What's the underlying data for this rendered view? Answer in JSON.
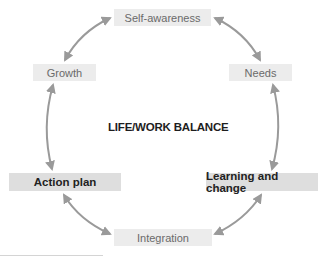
{
  "diagram": {
    "title": "LIFE/WORK BALANCE",
    "nodes": [
      {
        "id": "self-awareness",
        "label": "Self-awareness",
        "style": "light"
      },
      {
        "id": "needs",
        "label": "Needs",
        "style": "light"
      },
      {
        "id": "learning-and-change",
        "label": "Learning and change",
        "style": "bold"
      },
      {
        "id": "integration",
        "label": "Integration",
        "style": "light"
      },
      {
        "id": "action-plan",
        "label": "Action plan",
        "style": "bold"
      },
      {
        "id": "growth",
        "label": "Growth",
        "style": "light"
      }
    ],
    "edges": [
      {
        "from": "self-awareness",
        "to": "needs",
        "bidirectional": true
      },
      {
        "from": "needs",
        "to": "learning-and-change",
        "bidirectional": true
      },
      {
        "from": "learning-and-change",
        "to": "integration",
        "bidirectional": true
      },
      {
        "from": "integration",
        "to": "action-plan",
        "bidirectional": true
      },
      {
        "from": "action-plan",
        "to": "growth",
        "bidirectional": true
      },
      {
        "from": "growth",
        "to": "self-awareness",
        "bidirectional": true
      }
    ],
    "colors": {
      "arrow": "#9a9a9a",
      "light_box": "#ececec",
      "bold_box": "#dedede"
    }
  }
}
